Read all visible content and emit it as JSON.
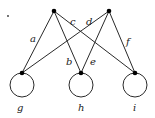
{
  "diagram": {
    "type": "graph",
    "vertices": [
      {
        "id": "top-left",
        "x": 54,
        "y": 11
      },
      {
        "id": "top-right",
        "x": 109,
        "y": 11
      },
      {
        "id": "g-vertex",
        "x": 22,
        "y": 73
      },
      {
        "id": "h-vertex",
        "x": 81,
        "y": 73
      },
      {
        "id": "i-vertex",
        "x": 135,
        "y": 73
      }
    ],
    "edges": [
      {
        "label": "a",
        "from": "top-left",
        "to": "g-vertex"
      },
      {
        "label": "b",
        "from": "top-left",
        "to": "h-vertex"
      },
      {
        "label": "c",
        "from": "top-left",
        "to": "i-vertex"
      },
      {
        "label": "d",
        "from": "top-right",
        "to": "g-vertex"
      },
      {
        "label": "e",
        "from": "top-right",
        "to": "h-vertex"
      },
      {
        "label": "f",
        "from": "top-right",
        "to": "i-vertex"
      }
    ],
    "loops": [
      {
        "label": "g",
        "at": "g-vertex"
      },
      {
        "label": "h",
        "at": "h-vertex"
      },
      {
        "label": "i",
        "at": "i-vertex"
      }
    ],
    "labels": {
      "a": "a",
      "b": "b",
      "c": "c",
      "d": "d",
      "e": "e",
      "f": "f",
      "g": "g",
      "h": "h",
      "i": "i"
    }
  }
}
